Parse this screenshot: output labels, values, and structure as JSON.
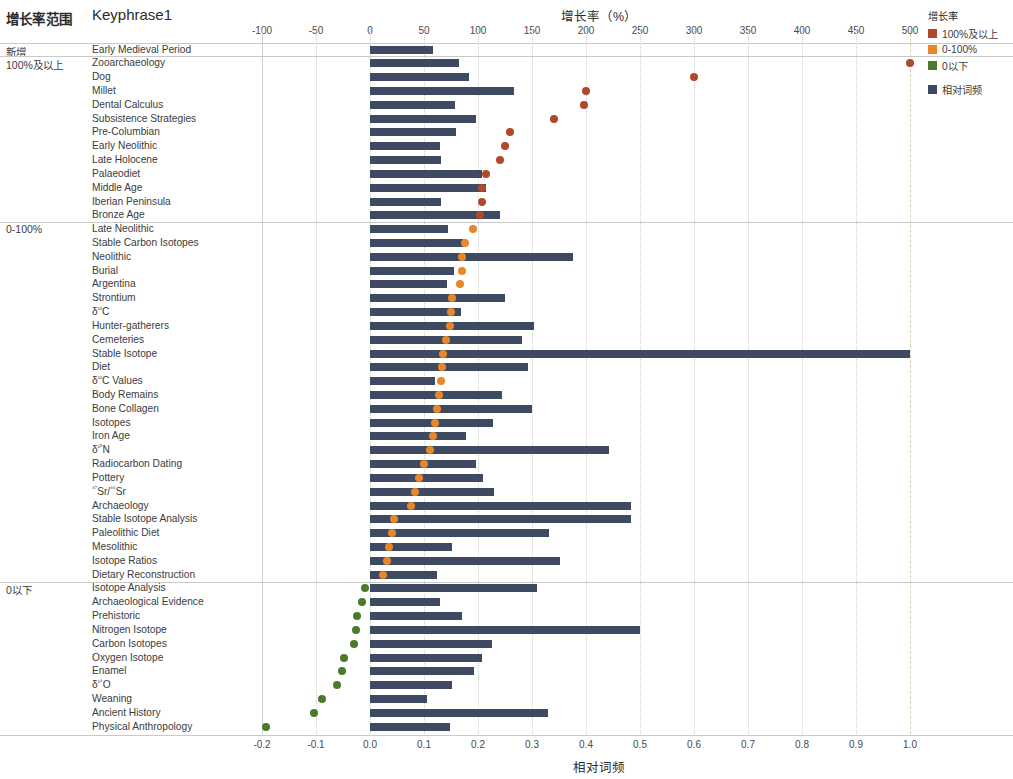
{
  "table": {
    "header_group": "增长率范围",
    "header_keyphrase": "Keyphrase1",
    "groups": [
      {
        "label": "新增",
        "row": 0
      },
      {
        "label": "100%及以上",
        "row": 1
      },
      {
        "label": "0-100%",
        "row": 13
      },
      {
        "label": "0以下",
        "row": 39
      }
    ]
  },
  "legend": {
    "title": "增长率",
    "items": [
      {
        "label": "100%及以上",
        "color": "#b0482c"
      },
      {
        "label": "0-100%",
        "color": "#e8862a"
      },
      {
        "label": "0以下",
        "color": "#4a7a2c"
      }
    ],
    "bar_item": {
      "label": "相对词频",
      "color": "#3d4a61"
    }
  },
  "axes": {
    "top": {
      "title": "增长率（%）",
      "ticks": [
        -100,
        -50,
        0,
        50,
        100,
        150,
        200,
        250,
        300,
        350,
        400,
        450,
        500
      ],
      "tick_labels": [
        "-100",
        "-50",
        "0",
        "50",
        "100",
        "150",
        "200",
        "250",
        "300",
        "350",
        "400",
        "450",
        "500"
      ],
      "min": -100,
      "max": 500
    },
    "bottom": {
      "title": "相对词频",
      "ticks": [
        -0.2,
        -0.1,
        0.0,
        0.1,
        0.2,
        0.3,
        0.4,
        0.5,
        0.6,
        0.7,
        0.8,
        0.9,
        1.0
      ],
      "tick_labels": [
        "-0.2",
        "-0.1",
        "0.0",
        "0.1",
        "0.2",
        "0.3",
        "0.4",
        "0.5",
        "0.6",
        "0.7",
        "0.8",
        "0.9",
        "1.0"
      ],
      "min": -0.2,
      "max": 1.0
    }
  },
  "chart_data": {
    "type": "bar",
    "xlabel": "相对词频",
    "ylabel": "Keyphrase1",
    "grid": true,
    "legend_position": "right",
    "series": [
      {
        "name": "相对词频",
        "type": "bar",
        "color": "#3d4a61",
        "axis": "bottom"
      },
      {
        "name": "增长率",
        "type": "scatter",
        "axis": "top"
      }
    ],
    "group_order": [
      "新增",
      "100%及以上",
      "0-100%",
      "0以下"
    ],
    "rows": [
      {
        "keyphrase": "Early Medieval Period",
        "group": "新增",
        "freq": 0.117,
        "growth": null,
        "color": null
      },
      {
        "keyphrase": "Zooarchaeology",
        "group": "100%及以上",
        "freq": 0.165,
        "growth": 500,
        "color": "#b0482c"
      },
      {
        "keyphrase": "Dog",
        "group": "100%及以上",
        "freq": 0.184,
        "growth": 300,
        "color": "#b0482c"
      },
      {
        "keyphrase": "Millet",
        "group": "100%及以上",
        "freq": 0.266,
        "growth": 200,
        "color": "#b0482c"
      },
      {
        "keyphrase": "Dental Calculus",
        "group": "100%及以上",
        "freq": 0.158,
        "growth": 198,
        "color": "#b0482c"
      },
      {
        "keyphrase": "Subsistence Strategies",
        "group": "100%及以上",
        "freq": 0.196,
        "growth": 170,
        "color": "#b0482c"
      },
      {
        "keyphrase": "Pre-Columbian",
        "group": "100%及以上",
        "freq": 0.16,
        "growth": 130,
        "color": "#b0482c"
      },
      {
        "keyphrase": "Early Neolithic",
        "group": "100%及以上",
        "freq": 0.13,
        "growth": 125,
        "color": "#b0482c"
      },
      {
        "keyphrase": "Late Holocene",
        "group": "100%及以上",
        "freq": 0.131,
        "growth": 120,
        "color": "#b0482c"
      },
      {
        "keyphrase": "Palaeodiet",
        "group": "100%及以上",
        "freq": 0.208,
        "growth": 107,
        "color": "#b0482c"
      },
      {
        "keyphrase": "Middle Age",
        "group": "100%及以上",
        "freq": 0.214,
        "growth": 104,
        "color": "#b0482c"
      },
      {
        "keyphrase": "Iberian Peninsula",
        "group": "100%及以上",
        "freq": 0.131,
        "growth": 104,
        "color": "#b0482c"
      },
      {
        "keyphrase": "Bronze Age",
        "group": "100%及以上",
        "freq": 0.24,
        "growth": 102,
        "color": "#b0482c"
      },
      {
        "keyphrase": "Late Neolithic",
        "group": "0-100%",
        "freq": 0.144,
        "growth": 95,
        "color": "#e8862a"
      },
      {
        "keyphrase": "Stable Carbon Isotopes",
        "group": "0-100%",
        "freq": 0.172,
        "growth": 88,
        "color": "#e8862a"
      },
      {
        "keyphrase": "Neolithic",
        "group": "0-100%",
        "freq": 0.375,
        "growth": 85,
        "color": "#e8862a"
      },
      {
        "keyphrase": "Burial",
        "group": "0-100%",
        "freq": 0.155,
        "growth": 85,
        "color": "#e8862a"
      },
      {
        "keyphrase": "Argentina",
        "group": "0-100%",
        "freq": 0.143,
        "growth": 83,
        "color": "#e8862a"
      },
      {
        "keyphrase": "Strontium",
        "group": "0-100%",
        "freq": 0.25,
        "growth": 76,
        "color": "#e8862a"
      },
      {
        "keyphrase": "δ¹³C",
        "group": "0-100%",
        "freq": 0.168,
        "growth": 75,
        "color": "#e8862a"
      },
      {
        "keyphrase": "Hunter-gatherers",
        "group": "0-100%",
        "freq": 0.304,
        "growth": 74,
        "color": "#e8862a"
      },
      {
        "keyphrase": "Cemeteries",
        "group": "0-100%",
        "freq": 0.281,
        "growth": 70,
        "color": "#e8862a"
      },
      {
        "keyphrase": "Stable Isotope",
        "group": "0-100%",
        "freq": 1.0,
        "growth": 68,
        "color": "#e8862a"
      },
      {
        "keyphrase": "Diet",
        "group": "0-100%",
        "freq": 0.292,
        "growth": 67,
        "color": "#e8862a"
      },
      {
        "keyphrase": "δ¹³C Values",
        "group": "0-100%",
        "freq": 0.12,
        "growth": 66,
        "color": "#e8862a"
      },
      {
        "keyphrase": "Body Remains",
        "group": "0-100%",
        "freq": 0.244,
        "growth": 64,
        "color": "#e8862a"
      },
      {
        "keyphrase": "Bone Collagen",
        "group": "0-100%",
        "freq": 0.3,
        "growth": 62,
        "color": "#e8862a"
      },
      {
        "keyphrase": "Isotopes",
        "group": "0-100%",
        "freq": 0.228,
        "growth": 60,
        "color": "#e8862a"
      },
      {
        "keyphrase": "Iron Age",
        "group": "0-100%",
        "freq": 0.177,
        "growth": 58,
        "color": "#e8862a"
      },
      {
        "keyphrase": "δ¹⁵N",
        "group": "0-100%",
        "freq": 0.443,
        "growth": 56,
        "color": "#e8862a"
      },
      {
        "keyphrase": "Radiocarbon Dating",
        "group": "0-100%",
        "freq": 0.196,
        "growth": 50,
        "color": "#e8862a"
      },
      {
        "keyphrase": "Pottery",
        "group": "0-100%",
        "freq": 0.209,
        "growth": 45,
        "color": "#e8862a"
      },
      {
        "keyphrase": "⁸⁷Sr/⁸⁶Sr",
        "group": "0-100%",
        "freq": 0.229,
        "growth": 42,
        "color": "#e8862a"
      },
      {
        "keyphrase": "Archaeology",
        "group": "0-100%",
        "freq": 0.484,
        "growth": 38,
        "color": "#e8862a"
      },
      {
        "keyphrase": "Stable Isotope Analysis",
        "group": "0-100%",
        "freq": 0.484,
        "growth": 22,
        "color": "#e8862a"
      },
      {
        "keyphrase": "Paleolithic Diet",
        "group": "0-100%",
        "freq": 0.332,
        "growth": 20,
        "color": "#e8862a"
      },
      {
        "keyphrase": "Mesolithic",
        "group": "0-100%",
        "freq": 0.151,
        "growth": 18,
        "color": "#e8862a"
      },
      {
        "keyphrase": "Isotope Ratios",
        "group": "0-100%",
        "freq": 0.352,
        "growth": 16,
        "color": "#e8862a"
      },
      {
        "keyphrase": "Dietary Reconstruction",
        "group": "0-100%",
        "freq": 0.124,
        "growth": 12,
        "color": "#e8862a"
      },
      {
        "keyphrase": "Isotope Analysis",
        "group": "0以下",
        "freq": 0.309,
        "growth": -5,
        "color": "#4a7a2c"
      },
      {
        "keyphrase": "Archaeological Evidence",
        "group": "0以下",
        "freq": 0.129,
        "growth": -7,
        "color": "#4a7a2c"
      },
      {
        "keyphrase": "Prehistoric",
        "group": "0以下",
        "freq": 0.17,
        "growth": -12,
        "color": "#4a7a2c"
      },
      {
        "keyphrase": "Nitrogen Isotope",
        "group": "0以下",
        "freq": 0.5,
        "growth": -13,
        "color": "#4a7a2c"
      },
      {
        "keyphrase": "Carbon Isotopes",
        "group": "0以下",
        "freq": 0.226,
        "growth": -15,
        "color": "#4a7a2c"
      },
      {
        "keyphrase": "Oxygen Isotope",
        "group": "0以下",
        "freq": 0.208,
        "growth": -24,
        "color": "#4a7a2c"
      },
      {
        "keyphrase": "Enamel",
        "group": "0以下",
        "freq": 0.193,
        "growth": -26,
        "color": "#4a7a2c"
      },
      {
        "keyphrase": "δ¹⁸O",
        "group": "0以下",
        "freq": 0.152,
        "growth": -31,
        "color": "#4a7a2c"
      },
      {
        "keyphrase": "Weaning",
        "group": "0以下",
        "freq": 0.105,
        "growth": -44,
        "color": "#4a7a2c"
      },
      {
        "keyphrase": "Ancient History",
        "group": "0以下",
        "freq": 0.33,
        "growth": -52,
        "color": "#4a7a2c"
      },
      {
        "keyphrase": "Physical Anthropology",
        "group": "0以下",
        "freq": 0.148,
        "growth": -96,
        "color": "#4a7a2c"
      }
    ]
  }
}
